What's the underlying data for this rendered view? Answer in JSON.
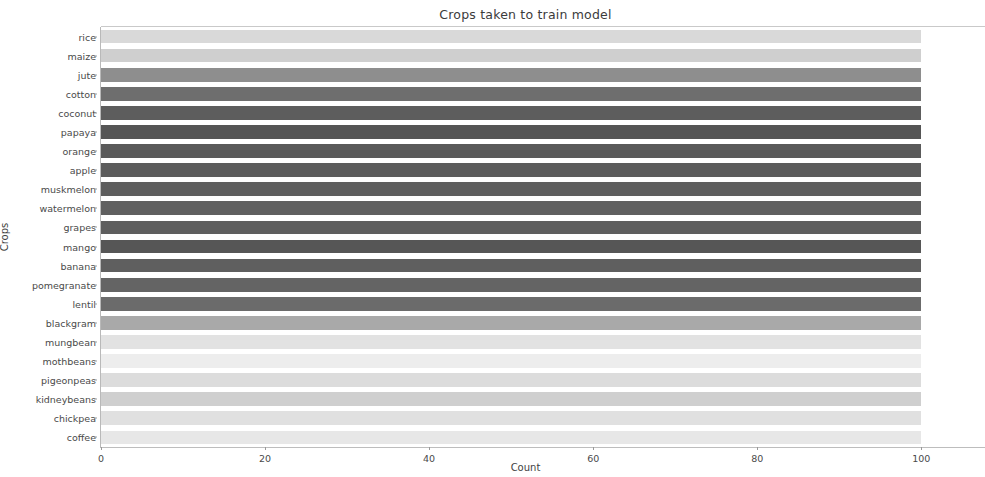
{
  "chart_data": {
    "type": "bar",
    "orientation": "horizontal",
    "title": "Crops taken to train model",
    "xlabel": "Count",
    "ylabel": "Crops",
    "xlim": [
      0,
      103.5
    ],
    "ylim_categories": 22,
    "grid": false,
    "legend": null,
    "xticks": [
      0,
      20,
      40,
      60,
      80,
      100
    ],
    "xtick_labels": [
      "0",
      "20",
      "40",
      "60",
      "80",
      "100"
    ],
    "categories": [
      "rice",
      "maize",
      "jute",
      "cotton",
      "coconut",
      "papaya",
      "orange",
      "apple",
      "muskmelon",
      "watermelon",
      "grapes",
      "mango",
      "banana",
      "pomegranate",
      "lentil",
      "blackgram",
      "mungbean",
      "mothbeans",
      "pigeonpeas",
      "kidneybeans",
      "chickpea",
      "coffee"
    ],
    "values": [
      100,
      100,
      100,
      100,
      100,
      100,
      100,
      100,
      100,
      100,
      100,
      100,
      100,
      100,
      100,
      100,
      100,
      100,
      100,
      100,
      100,
      100
    ],
    "bar_colors": [
      "#d9d9d9",
      "#cfcfcf",
      "#8e8e8e",
      "#6e6e6e",
      "#5d5d5d",
      "#555555",
      "#5a5a5a",
      "#5c5c5c",
      "#5e5e5e",
      "#606060",
      "#5e5e5e",
      "#565656",
      "#5f5f5f",
      "#646464",
      "#6b6b6b",
      "#a9a9a9",
      "#e2e2e2",
      "#ededed",
      "#dcdcdc",
      "#cfcfcf",
      "#e0e0e0",
      "#e7e7e7"
    ]
  }
}
